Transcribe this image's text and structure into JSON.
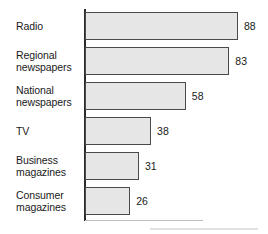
{
  "chart_data": {
    "type": "bar",
    "orientation": "horizontal",
    "title": "",
    "subtitle": "",
    "xlabel": "",
    "ylabel": "",
    "categories": [
      "Radio",
      "Regional newspapers",
      "National newspapers",
      "TV",
      "Business magazines",
      "Consumer magazines"
    ],
    "category_lines": [
      [
        "Radio"
      ],
      [
        "Regional",
        "newspapers"
      ],
      [
        "National",
        "newspapers"
      ],
      [
        "TV"
      ],
      [
        "Business",
        "magazines"
      ],
      [
        "Consumer",
        "magazines"
      ]
    ],
    "values": [
      88,
      83,
      58,
      38,
      31,
      26
    ],
    "value_labels": [
      "88",
      "83",
      "58",
      "38",
      "31",
      "26"
    ],
    "xlim": [
      0,
      88
    ],
    "grid": false,
    "legend": null,
    "annotations": []
  },
  "style": {
    "bar_fill": "#e6e6e6",
    "bar_border": "#4a4a4a",
    "axis_color": "#2b2b2b",
    "text_color": "#1a1a1a",
    "background": "#ffffff"
  }
}
